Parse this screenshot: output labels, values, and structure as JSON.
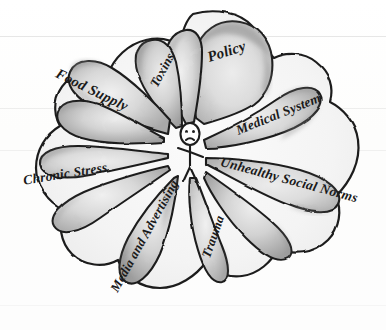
{
  "diagram": {
    "type": "radial-petal-diagram",
    "style": "hand-drawn pencil sketch, grayscale",
    "center": {
      "name": "person",
      "description": "stick figure with frowning face",
      "label": ""
    },
    "colors": {
      "background": "#ffffff",
      "petal_fill_light": "#e2e2e2",
      "petal_fill_mid": "#cfcfcf",
      "petal_edge_shade": "#9a9a9a",
      "outline": "#1d1d1d",
      "text": "#1a1a1a"
    },
    "petals": [
      {
        "id": "policy",
        "label": "Policy",
        "angle_deg": -68,
        "text_rotate": -18
      },
      {
        "id": "toxins",
        "label": "Toxins",
        "angle_deg": -100,
        "text_rotate": -62
      },
      {
        "id": "food-supply",
        "label": "Food Supply",
        "angle_deg": -143,
        "text_rotate": 26
      },
      {
        "id": "chronic-stress",
        "label": "Chronic Stress",
        "angle_deg": 177,
        "text_rotate": -9
      },
      {
        "id": "media-and-advertising",
        "label": "Media and Advertising",
        "angle_deg": 104,
        "text_rotate": -61
      },
      {
        "id": "trauma",
        "label": "Trauma",
        "angle_deg": 76,
        "text_rotate": -71
      },
      {
        "id": "unhealthy-social-norms",
        "label": "Unhealthy Social Norms",
        "angle_deg": 28,
        "text_rotate": 15
      },
      {
        "id": "medical-system",
        "label": "Medical System",
        "angle_deg": -25,
        "text_rotate": -22
      }
    ]
  }
}
